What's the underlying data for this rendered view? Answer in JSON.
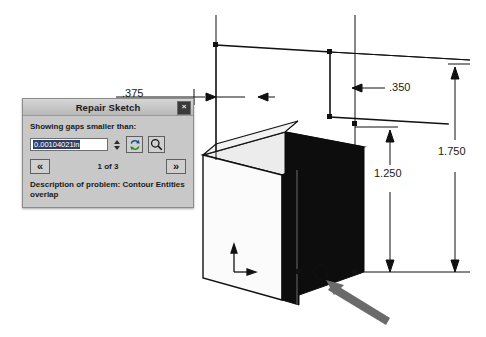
{
  "app": {
    "title": "Repair Sketch"
  },
  "dialog": {
    "title": "Repair Sketch",
    "close_label": "×",
    "gaps_label": "Showing gaps smaller than:",
    "gap_value": "0.00104021in",
    "gap_placeholder": "0.00104021in",
    "refresh_icon": "refresh-icon",
    "zoom_icon": "magnifier-icon",
    "prev_label": "«",
    "next_label": "»",
    "counter": "1 of 3",
    "problem_description": "Description of problem:  Contour Entities overlap",
    "background_color": "#c8c8c8",
    "titlebar_color": "#b8b8b8",
    "selection_color": "#2f3f6b"
  },
  "drawing": {
    "dimensions": [
      {
        "name": "width-top-left",
        "label": ".375"
      },
      {
        "name": "step-width",
        "label": ".350"
      },
      {
        "name": "step-height",
        "label": "1.250"
      },
      {
        "name": "overall-height",
        "label": "1.750"
      }
    ],
    "origin_marker": "origin-triad",
    "gap_highlight": "gap-circle-marker",
    "pointer": "callout-arrow",
    "colors": {
      "line": "#111111",
      "shaded_face": "#0d0d0d",
      "top_face": "#e8e8e8",
      "side_face": "#f4f4f4",
      "arrow": "#6a6a6a"
    }
  }
}
